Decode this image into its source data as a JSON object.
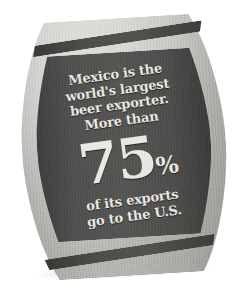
{
  "graphic": {
    "subject": "beer-barrel-infographic",
    "background_color": "#ffffff",
    "barrel_frame_color": "#c6c5bf",
    "barrel_face_color": "#525250",
    "hoop_color": "#414140",
    "text_color": "#e9e7e1"
  },
  "copy": {
    "headline_line1": "Mexico is the",
    "headline_line2": "world's largest",
    "headline_line3": "beer exporter.",
    "headline_line4": "More than",
    "stat_number": "75",
    "stat_symbol": "%",
    "subline_line1": "of its exports",
    "subline_line2": "go to the U.S."
  }
}
